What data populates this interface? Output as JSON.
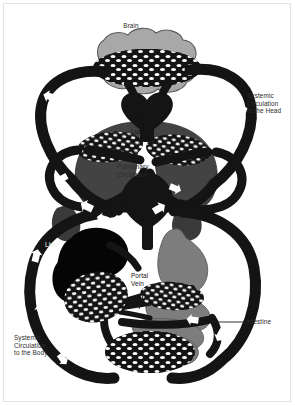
{
  "figure": {
    "title_visible": false,
    "background_color": "#ffffff",
    "frame_color": "#e3e3e3"
  },
  "palette": {
    "vessel_black": "#141414",
    "brain_gray": "#a8a8a8",
    "lung_gray": "#434343",
    "organ_gray": "#7d7d7d",
    "liver_black": "#050505",
    "capillary_black": "#141414",
    "arrow_white": "#ffffff",
    "outline_gray": "#5a5a5a",
    "text_dark": "#2b2b2b",
    "text_light": "#f2f2f2"
  },
  "labels": [
    {
      "id": "brain",
      "text": "Brain",
      "x": 122,
      "y": 26,
      "align": "left",
      "tone": "dark"
    },
    {
      "id": "systemic-head",
      "text": "Systemic\nCirculation\nto the Head",
      "x": 247,
      "y": 96,
      "align": "left",
      "tone": "dark"
    },
    {
      "id": "lungs",
      "text": "Lungs",
      "x": 133,
      "y": 131,
      "align": "left",
      "tone": "dark-on-dark"
    },
    {
      "id": "pulmonary",
      "text": "Pulmonary\nCirculation",
      "x": 118,
      "y": 166,
      "align": "left",
      "tone": "dark"
    },
    {
      "id": "liver",
      "text": "Liver",
      "x": 45,
      "y": 244,
      "align": "left",
      "tone": "light"
    },
    {
      "id": "portal-vein",
      "text": "Portal\nVein",
      "x": 132,
      "y": 276,
      "align": "left",
      "tone": "dark-on-dark"
    },
    {
      "id": "intestine",
      "text": "Intestine",
      "x": 246,
      "y": 320,
      "align": "left",
      "tone": "dark"
    },
    {
      "id": "systemic-body",
      "text": "Systemic\nCirculation\nto the Body",
      "x": 14,
      "y": 337,
      "align": "left",
      "tone": "dark"
    }
  ],
  "leaders": [
    {
      "id": "portal-vein-leader",
      "x1": 145,
      "y1": 289,
      "x2": 139,
      "y2": 309
    },
    {
      "id": "intestine-leader",
      "x1": 201,
      "y1": 322,
      "x2": 243,
      "y2": 322
    }
  ],
  "organs": [
    {
      "id": "brain",
      "label": "Brain",
      "fill": "#a8a8a8",
      "type": "organ"
    },
    {
      "id": "lungs",
      "label": "Lungs",
      "fill": "#434343",
      "type": "organ"
    },
    {
      "id": "heart",
      "label": "Heart",
      "fill": "#141414",
      "type": "pump"
    },
    {
      "id": "liver",
      "label": "Liver",
      "fill": "#050505",
      "type": "organ"
    },
    {
      "id": "stomach",
      "label": "Stomach",
      "fill": "#7d7d7d",
      "type": "organ"
    },
    {
      "id": "intestine",
      "label": "Intestine",
      "fill": "#7d7d7d",
      "type": "organ"
    },
    {
      "id": "kidneys",
      "label": "Kidneys",
      "fill": "#3a3a3a",
      "type": "organ"
    }
  ],
  "circuits": [
    {
      "id": "systemic-head",
      "label": "Systemic Circulation to the Head"
    },
    {
      "id": "pulmonary",
      "label": "Pulmonary Circulation"
    },
    {
      "id": "portal",
      "label": "Portal Vein"
    },
    {
      "id": "systemic-body",
      "label": "Systemic Circulation to the Body"
    }
  ],
  "flow_arrows": [
    {
      "id": "arrow-head-left-down",
      "x": 52,
      "y": 96,
      "angle": 200
    },
    {
      "id": "arrow-head-right-up",
      "x": 231,
      "y": 108,
      "angle": 340
    },
    {
      "id": "arrow-pulm-left",
      "x": 63,
      "y": 177,
      "angle": 160
    },
    {
      "id": "arrow-pulm-right",
      "x": 172,
      "y": 186,
      "angle": 25
    },
    {
      "id": "arrow-heart-left",
      "x": 85,
      "y": 205,
      "angle": 205
    },
    {
      "id": "arrow-heart-right",
      "x": 155,
      "y": 207,
      "angle": 330
    },
    {
      "id": "arrow-body-left-up",
      "x": 38,
      "y": 254,
      "angle": 285
    },
    {
      "id": "arrow-body-right-down",
      "x": 231,
      "y": 278,
      "angle": 105
    },
    {
      "id": "arrow-body-left-low",
      "x": 43,
      "y": 307,
      "angle": 250
    },
    {
      "id": "arrow-portal-right",
      "x": 191,
      "y": 318,
      "angle": 190
    },
    {
      "id": "arrow-body-right-low",
      "x": 219,
      "y": 330,
      "angle": 120
    },
    {
      "id": "arrow-liver-in",
      "x": 98,
      "y": 218,
      "angle": 195
    }
  ]
}
